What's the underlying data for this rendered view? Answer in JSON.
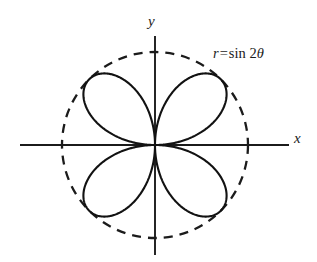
{
  "figure": {
    "background_color": "#ffffff",
    "curve_color": "#121212",
    "axis_color": "#1b1b1b"
  },
  "labels": {
    "x_axis": "x",
    "y_axis": "y"
  },
  "equation": {
    "lhs": "r",
    "operator": "=",
    "function": "sin",
    "coefficient": "2",
    "variable": "θ",
    "full_text": "r = sin 2θ"
  },
  "chart_data": {
    "type": "line",
    "subtype": "polar-rose",
    "equation": "r = sin 2θ",
    "xlabel": "x",
    "ylabel": "y",
    "grid": false,
    "legend": null,
    "coordinate_system": "polar",
    "xlim": [
      -1.45,
      1.45
    ],
    "ylim": [
      -1.18,
      1.18
    ],
    "petal_count": 4,
    "max_radius": 1,
    "petal_tip_angles_deg": [
      45,
      135,
      225,
      315
    ],
    "petal_tip_points_xy": [
      [
        0.7071,
        0.7071
      ],
      [
        -0.7071,
        0.7071
      ],
      [
        -0.7071,
        -0.7071
      ],
      [
        0.7071,
        -0.7071
      ]
    ],
    "reference_circle": {
      "type": "circle",
      "radius": 1,
      "center": [
        0,
        0
      ],
      "style": "dashed",
      "label": "unit circle r = 1"
    },
    "series": [
      {
        "name": "r = sin 2θ",
        "style": "solid",
        "theta_deg": [
          0,
          10,
          20,
          30,
          40,
          45,
          50,
          60,
          70,
          80,
          90,
          100,
          110,
          120,
          130,
          135,
          140,
          150,
          160,
          170,
          180,
          190,
          200,
          210,
          220,
          225,
          230,
          240,
          250,
          260,
          270,
          280,
          290,
          300,
          310,
          315,
          320,
          330,
          340,
          350,
          360
        ],
        "r": [
          0,
          0.342,
          0.643,
          0.866,
          0.985,
          1,
          0.985,
          0.866,
          0.643,
          0.342,
          0,
          -0.342,
          -0.643,
          -0.866,
          -0.985,
          -1,
          -0.985,
          -0.866,
          -0.643,
          -0.342,
          0,
          0.342,
          0.643,
          0.866,
          0.985,
          1,
          0.985,
          0.866,
          0.643,
          0.342,
          0,
          -0.342,
          -0.643,
          -0.866,
          -0.985,
          -1,
          -0.985,
          -0.866,
          -0.643,
          -0.342,
          0
        ]
      }
    ],
    "axes": {
      "x_axis_range": [
        -1.42,
        1.42
      ],
      "y_axis_range": [
        -1.15,
        1.15
      ],
      "ticks": [],
      "tick_labels": []
    }
  }
}
